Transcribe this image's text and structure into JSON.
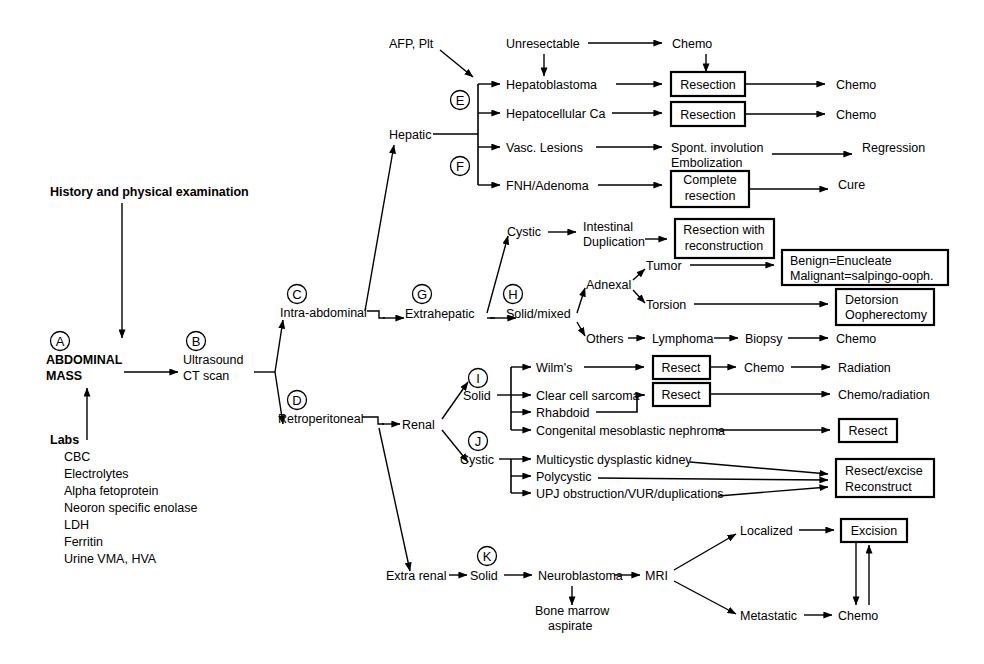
{
  "diagram": {
    "root": {
      "history": "History and physical examination",
      "mass_line1": "ABDOMINAL",
      "mass_line2": "MASS",
      "labs_heading": "Labs",
      "labs": [
        "CBC",
        "Electrolytes",
        "Alpha fetoprotein",
        "Neoron specific enolase",
        "LDH",
        "Ferritin",
        "Urine VMA, HVA"
      ],
      "imaging_line1": "Ultrasound",
      "imaging_line2": "CT scan"
    },
    "markers": {
      "a": "A",
      "b": "B",
      "c": "C",
      "d": "D",
      "e": "E",
      "f": "F",
      "g": "G",
      "h": "H",
      "i": "I",
      "j": "J",
      "k": "K"
    },
    "nodes": {
      "intra_abdominal": "Intra-abdominal",
      "retroperitoneal": "Retroperitoneal",
      "hepatic": "Hepatic",
      "extrahepatic": "Extrahepatic",
      "afp_plt": "AFP, Plt",
      "unresectable": "Unresectable",
      "chemo_top": "Chemo",
      "hepatoblastoma": "Hepatoblastoma",
      "hepatocellular_ca": "Hepatocellular Ca",
      "vasc_lesions": "Vasc. Lesions",
      "fnh_adenoma": "FNH/Adenoma",
      "resection_1": "Resection",
      "resection_2": "Resection",
      "chemo_1": "Chemo",
      "chemo_2": "Chemo",
      "spont_involution": "Spont. involution",
      "embolization": "Embolization",
      "regression": "Regression",
      "complete_1": "Complete",
      "complete_2": "resection",
      "cure": "Cure",
      "cystic_eh": "Cystic",
      "intestinal": "Intestinal",
      "duplication": "Duplication",
      "resection_with": "Resection with",
      "reconstruction": "reconstruction",
      "solid_mixed": "Solid/mixed",
      "adnexal": "Adnexal",
      "tumor": "Tumor",
      "torsion": "Torsion",
      "others": "Others",
      "benign_enucleate": "Benign=Enucleate",
      "malignant_salpingo": "Malignant=salpingo-ooph.",
      "detorsion": "Detorsion",
      "oopherectomy": "Oopherectomy",
      "lymphoma": "Lymphoma",
      "biopsy": "Biopsy",
      "chemo_lymph": "Chemo",
      "renal": "Renal",
      "solid_renal": "Solid",
      "cystic_renal": "Cystic",
      "wilms": "Wilm's",
      "clear_cell_sarcoma": "Clear cell sarcoma",
      "rhabdoid": "Rhabdoid",
      "congenital_mesoblastic": "Congenital mesoblastic nephroma",
      "resect_1": "Resect",
      "resect_2": "Resect",
      "resect_3": "Resect",
      "chemo_wilms": "Chemo",
      "radiation": "Radiation",
      "chemo_radiation": "Chemo/radiation",
      "multicystic": "Multicystic dysplastic kidney",
      "polycystic": "Polycystic",
      "upj": "UPJ obstruction/VUR/duplications",
      "resect_excise": "Resect/excise",
      "reconstruct": "Reconstruct",
      "extra_renal": "Extra renal",
      "solid_extra": "Solid",
      "neuroblastoma": "Neuroblastoma",
      "bone_marrow": "Bone marrow",
      "aspirate": "aspirate",
      "mri": "MRI",
      "localized": "Localized",
      "metastatic": "Metastatic",
      "excision": "Excision",
      "chemo_meta": "Chemo"
    }
  },
  "colors": {
    "stroke": "#000000",
    "background": "#ffffff",
    "box_fill": "#ffffff"
  }
}
